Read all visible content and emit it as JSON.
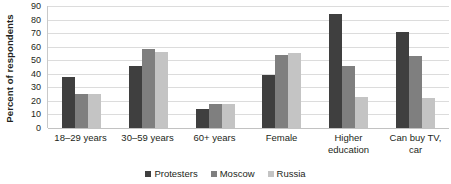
{
  "chart_data": {
    "type": "bar",
    "title": "",
    "xlabel": "",
    "ylabel": "Percent of respondents",
    "ylim": [
      0,
      90
    ],
    "yticks": [
      90,
      80,
      70,
      60,
      50,
      40,
      30,
      20,
      10,
      0
    ],
    "grid": true,
    "legend_position": "bottom",
    "categories": [
      "18–29 years",
      "30–59 years",
      "60+ years",
      "Female",
      "Higher education",
      "Can buy TV, car"
    ],
    "series": [
      {
        "name": "Protesters",
        "color": "#3f3f3f",
        "values": [
          38,
          46,
          14,
          39,
          84,
          71
        ]
      },
      {
        "name": "Moscow",
        "color": "#7f7f7f",
        "values": [
          25,
          58,
          18,
          54,
          46,
          53
        ]
      },
      {
        "name": "Russia",
        "color": "#c4c4c4",
        "values": [
          25,
          56,
          18,
          55,
          23,
          22
        ]
      }
    ]
  },
  "legend": {
    "items": [
      {
        "label": "Protesters"
      },
      {
        "label": "Moscow"
      },
      {
        "label": "Russia"
      }
    ]
  }
}
